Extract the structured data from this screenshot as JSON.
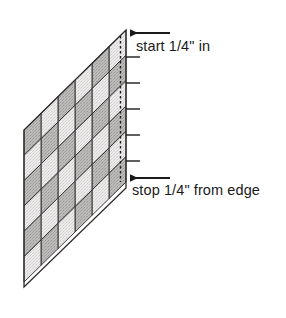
{
  "diagram": {
    "annotations": [
      {
        "id": "start",
        "text": "start 1/4\" in",
        "arrow": "left-pointing-arrow",
        "arrow_x_start": 170,
        "arrow_x_end": 130,
        "arrow_y": 33
      },
      {
        "id": "stop",
        "text": "stop 1/4\" from edge",
        "arrow": "left-pointing-arrow",
        "arrow_x_start": 170,
        "arrow_x_end": 130,
        "arrow_y": 178
      }
    ],
    "grid": {
      "columns": 6,
      "rows": 6,
      "shape": "parallelogram",
      "corners": {
        "top_right": [
          126,
          30
        ],
        "bottom_right": [
          126,
          188
        ],
        "bottom_left": [
          24,
          287
        ],
        "top_left": [
          24,
          130
        ]
      },
      "fill_light": "#e3e3e3",
      "fill_dark": "#b4b4b4",
      "outline": "#2b2b2b"
    },
    "stitch_line": {
      "style": "dashed",
      "color": "#1a1a1a",
      "x": 120,
      "y_top": 36,
      "y_bottom": 182
    },
    "tick_marks": {
      "count": 5,
      "color": "#1a1a1a",
      "x_start": 126,
      "x_end": 140,
      "y_values": [
        57,
        83,
        109,
        135,
        161
      ]
    },
    "colors": {
      "ink": "#1a1a1a",
      "paper": "#ffffff",
      "patch_light": "#e3e3e3",
      "patch_dark": "#b4b4b4"
    }
  }
}
